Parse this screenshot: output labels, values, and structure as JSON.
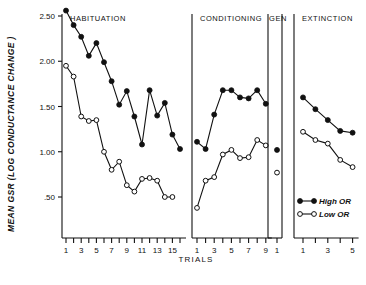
{
  "chart_data": {
    "type": "line",
    "title": "",
    "ylabel": "MEAN GSR (LOG CONDUCTANCE CHANGE )",
    "xlabel": "TRIALS",
    "ylim": [
      0.25,
      2.6
    ],
    "yticks": [
      2.5,
      2.0,
      1.5,
      1.0,
      0.5
    ],
    "ytick_labels": [
      "2.50",
      "2.00",
      "1.50",
      "1.00",
      ".50"
    ],
    "grid": false,
    "legend_position": "bottom-right",
    "legend": [
      {
        "name": "High OR",
        "marker": "filled-circle"
      },
      {
        "name": "Low OR",
        "marker": "open-circle"
      }
    ],
    "panels": [
      {
        "name": "HABITUATION",
        "xticks": [
          1,
          3,
          5,
          7,
          9,
          11,
          13,
          15
        ],
        "xtick_labels": [
          "1",
          "3",
          "5",
          "7",
          "9",
          "11",
          "13",
          "15"
        ],
        "x": [
          1,
          2,
          3,
          4,
          5,
          6,
          7,
          8,
          9,
          10,
          11,
          12,
          13,
          14,
          15,
          16
        ],
        "series": [
          {
            "name": "High OR",
            "marker": "filled-circle",
            "values": [
              2.56,
              2.4,
              2.27,
              2.06,
              2.2,
              1.99,
              1.78,
              1.52,
              1.67,
              1.39,
              1.08,
              1.68,
              1.4,
              1.54,
              1.19,
              1.03
            ]
          },
          {
            "name": "Low OR",
            "marker": "open-circle",
            "values": [
              1.95,
              1.83,
              1.39,
              1.34,
              1.35,
              1.0,
              0.8,
              0.89,
              0.63,
              0.56,
              0.7,
              0.71,
              0.68,
              0.5,
              0.5,
              null
            ]
          }
        ]
      },
      {
        "name": "CONDITIONING",
        "xticks": [
          1,
          3,
          5,
          7,
          9
        ],
        "xtick_labels": [
          "1",
          "3",
          "5",
          "7",
          "9"
        ],
        "x": [
          1,
          2,
          3,
          4,
          5,
          6,
          7,
          8,
          9
        ],
        "series": [
          {
            "name": "High OR",
            "marker": "filled-circle",
            "values": [
              1.11,
              1.03,
              1.41,
              1.68,
              1.68,
              1.6,
              1.59,
              1.68,
              1.53
            ]
          },
          {
            "name": "Low OR",
            "marker": "open-circle",
            "values": [
              0.38,
              0.68,
              0.72,
              0.97,
              1.02,
              0.93,
              0.94,
              1.13,
              1.07
            ]
          }
        ]
      },
      {
        "name": "GEN",
        "xticks": [
          1
        ],
        "xtick_labels": [
          "1"
        ],
        "x": [
          1
        ],
        "series": [
          {
            "name": "High OR",
            "marker": "filled-circle",
            "values": [
              1.02
            ]
          },
          {
            "name": "Low OR",
            "marker": "open-circle",
            "values": [
              0.77
            ]
          }
        ]
      },
      {
        "name": "EXTINCTION",
        "xticks": [
          1,
          3,
          5
        ],
        "xtick_labels": [
          "1",
          "3",
          "5"
        ],
        "x": [
          1,
          2,
          3,
          4,
          5
        ],
        "series": [
          {
            "name": "High OR",
            "marker": "filled-circle",
            "values": [
              1.6,
              1.47,
              1.35,
              1.23,
              1.21
            ]
          },
          {
            "name": "Low OR",
            "marker": "open-circle",
            "values": [
              1.22,
              1.13,
              1.09,
              0.91,
              0.83
            ]
          }
        ]
      }
    ]
  },
  "colors": {
    "ink": "#111111",
    "background": "#ffffff"
  }
}
